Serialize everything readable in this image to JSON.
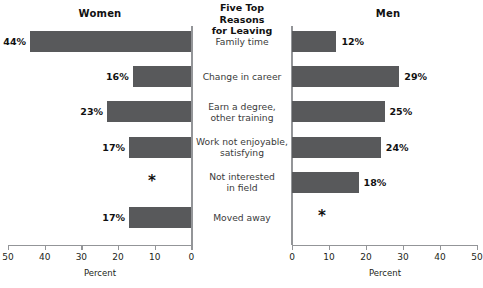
{
  "center_title": {
    "lines": [
      "Five Top Reasons",
      "for Leaving"
    ]
  },
  "panels": {
    "left": {
      "title": "Women",
      "axis_caption": "Percent"
    },
    "right": {
      "title": "Men",
      "axis_caption": "Percent"
    }
  },
  "axis": {
    "left_ticks": [
      "50",
      "40",
      "30",
      "20",
      "10",
      "0"
    ],
    "right_ticks": [
      "0",
      "10",
      "20",
      "30",
      "40",
      "50"
    ]
  },
  "categories": [
    {
      "lines": [
        "Family time"
      ]
    },
    {
      "lines": [
        "Change in career"
      ]
    },
    {
      "lines": [
        "Earn a degree,",
        "other training"
      ]
    },
    {
      "lines": [
        "Work not enjoyable,",
        "satisfying"
      ]
    },
    {
      "lines": [
        "Not interested",
        "in field"
      ]
    },
    {
      "lines": [
        "Moved away"
      ]
    }
  ],
  "women_labels": [
    "44%",
    "16%",
    "23%",
    "17%",
    "*",
    "17%"
  ],
  "men_labels": [
    "12%",
    "29%",
    "25%",
    "24%",
    "18%",
    "*"
  ],
  "colors": {
    "bar": "#58595b",
    "axis": "#939598",
    "label_text": "#3b3b3b",
    "value_text": "#111111"
  },
  "chart_data": {
    "type": "bar",
    "title": "Five Top Reasons for Leaving",
    "orientation": "horizontal",
    "layout": "diverging-paired-panels",
    "categories": [
      "Family time",
      "Change in career",
      "Earn a degree, other training",
      "Work not enjoyable, satisfying",
      "Not interested in field",
      "Moved away"
    ],
    "series": [
      {
        "name": "Women",
        "values": [
          44,
          16,
          23,
          17,
          null,
          17
        ],
        "labels": [
          "44%",
          "16%",
          "23%",
          "17%",
          "*",
          "17%"
        ],
        "axis_direction": "right-to-left"
      },
      {
        "name": "Men",
        "values": [
          12,
          29,
          25,
          24,
          18,
          null
        ],
        "labels": [
          "12%",
          "29%",
          "25%",
          "24%",
          "18%",
          "*"
        ],
        "axis_direction": "left-to-right"
      }
    ],
    "xlabel": "Percent",
    "ylabel": "",
    "xlim": [
      0,
      50
    ],
    "xticks": [
      0,
      10,
      20,
      30,
      40,
      50
    ],
    "grid": false,
    "legend": "none"
  }
}
